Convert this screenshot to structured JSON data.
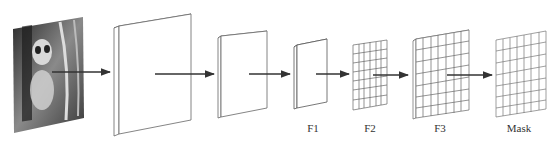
{
  "diagram": {
    "title": "",
    "stages": [
      {
        "id": "input",
        "label": "",
        "kind": "image",
        "content": "panda-photo"
      },
      {
        "id": "layer1",
        "label": "",
        "kind": "plane"
      },
      {
        "id": "layer2",
        "label": "",
        "kind": "plane"
      },
      {
        "id": "f1",
        "label": "F1",
        "kind": "plane"
      },
      {
        "id": "f2",
        "label": "F2",
        "kind": "grid"
      },
      {
        "id": "f3",
        "label": "F3",
        "kind": "grid"
      },
      {
        "id": "mask",
        "label": "Mask",
        "kind": "grid"
      }
    ],
    "arrows": [
      {
        "from": "input",
        "to": "layer1"
      },
      {
        "from": "layer1",
        "to": "layer2"
      },
      {
        "from": "layer2",
        "to": "f1"
      },
      {
        "from": "f1",
        "to": "f2"
      },
      {
        "from": "f2",
        "to": "f3"
      },
      {
        "from": "f3",
        "to": "mask"
      }
    ],
    "colors": {
      "line": "#555555",
      "arrow": "#333333",
      "background": "#ffffff"
    }
  }
}
